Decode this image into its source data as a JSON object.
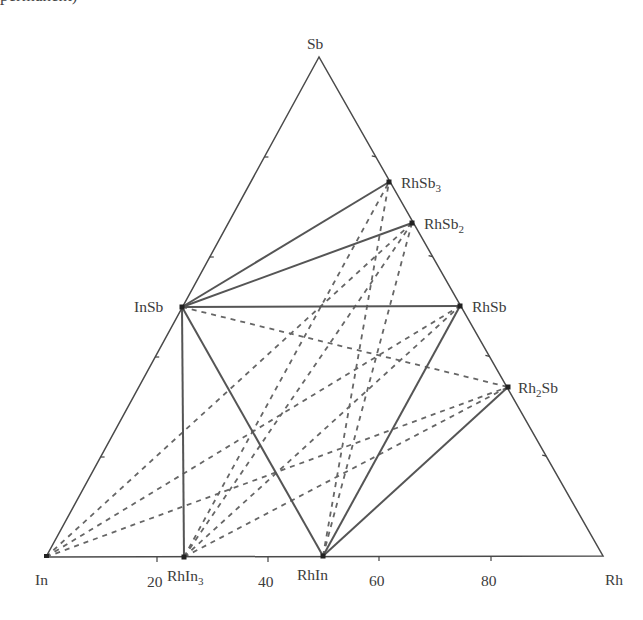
{
  "page": {
    "top_fragment": "permanent)"
  },
  "chart_data": {
    "type": "ternary-phase-diagram",
    "title": "",
    "system": "In–Rh–Sb",
    "vertices": {
      "top": {
        "label": "Sb",
        "xy": [
          319,
          57
        ]
      },
      "left": {
        "label": "In",
        "xy": [
          46,
          557
        ]
      },
      "right": {
        "label": "Rh",
        "xy": [
          603,
          556
        ]
      }
    },
    "bottom_axis_ticks": [
      {
        "label": "20",
        "xy": [
          157,
          557
        ]
      },
      {
        "label": "40",
        "xy": [
          268,
          557
        ]
      },
      {
        "label": "60",
        "xy": [
          379,
          556
        ]
      },
      {
        "label": "80",
        "xy": [
          491,
          556
        ]
      }
    ],
    "phases": [
      {
        "id": "InSb",
        "label": "InSb",
        "sub": "",
        "xy": [
          182,
          307
        ]
      },
      {
        "id": "RhSb3",
        "label": "RhSb",
        "sub": "3",
        "xy": [
          389,
          182
        ]
      },
      {
        "id": "RhSb2",
        "label": "RhSb",
        "sub": "2",
        "xy": [
          412,
          223
        ]
      },
      {
        "id": "RhSb",
        "label": "RhSb",
        "sub": "",
        "xy": [
          460,
          306
        ]
      },
      {
        "id": "Rh2Sb",
        "label": "Rh",
        "sub": "2",
        "suffix": "Sb",
        "xy": [
          508,
          387
        ]
      },
      {
        "id": "RhIn3",
        "label": "RhIn",
        "sub": "3",
        "xy": [
          184,
          557
        ]
      },
      {
        "id": "RhIn",
        "label": "RhIn",
        "sub": "",
        "xy": [
          323,
          556
        ]
      }
    ],
    "solid_tie_lines": [
      [
        "InSb",
        "RhSb3"
      ],
      [
        "InSb",
        "RhSb2"
      ],
      [
        "InSb",
        "RhSb"
      ],
      [
        "InSb",
        "RhIn3"
      ],
      [
        "InSb",
        "RhIn"
      ],
      [
        "RhIn",
        "RhSb"
      ],
      [
        "RhIn",
        "Rh2Sb"
      ]
    ],
    "dashed_tie_lines": [
      [
        "In",
        "RhSb2"
      ],
      [
        "In",
        "RhSb"
      ],
      [
        "In",
        "Rh2Sb"
      ],
      [
        "RhIn3",
        "RhSb3"
      ],
      [
        "RhIn3",
        "RhSb2"
      ],
      [
        "RhIn3",
        "RhSb"
      ],
      [
        "RhIn3",
        "Rh2Sb"
      ],
      [
        "InSb",
        "Rh2Sb"
      ],
      [
        "RhIn",
        "RhSb3"
      ],
      [
        "RhIn",
        "RhSb2"
      ]
    ],
    "colors": {
      "lines": "#4a4a4a",
      "dashes": "#666666",
      "points": "#222222"
    }
  }
}
